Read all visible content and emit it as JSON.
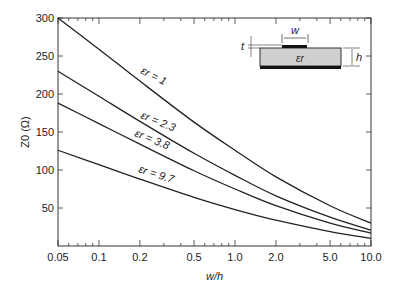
{
  "chart_data": {
    "type": "line",
    "title": "",
    "xlabel": "w/h",
    "ylabel": "Z0 (Ω)",
    "xscale": "log",
    "xlim": [
      0.05,
      10.0
    ],
    "ylim": [
      0,
      300
    ],
    "grid": false,
    "x_ticks": [
      "0.05",
      "0.1",
      "0.2",
      "0.5",
      "1.0",
      "2.0",
      "5.0",
      "10.0"
    ],
    "y_ticks": [
      "50",
      "100",
      "150",
      "200",
      "250",
      "300"
    ],
    "x": [
      0.05,
      0.1,
      0.2,
      0.5,
      1.0,
      2.0,
      5.0,
      10.0
    ],
    "series": [
      {
        "name": "εr = 1",
        "values": [
          300,
          259,
          217,
          163,
          126,
          91,
          53,
          30
        ]
      },
      {
        "name": "εr = 2.3",
        "values": [
          230,
          197,
          164,
          122,
          93,
          66,
          38,
          21
        ]
      },
      {
        "name": "εr = 3.8",
        "values": [
          188,
          161,
          134,
          99,
          75,
          53,
          30,
          17
        ]
      },
      {
        "name": "εr = 9.7",
        "values": [
          126,
          107,
          88,
          64,
          48,
          34,
          19,
          10
        ]
      }
    ],
    "annotations": [
      "εr = 1",
      "εr = 2.3",
      "εr = 3.8",
      "εr = 9.7"
    ],
    "inset": {
      "labels": {
        "w": "w",
        "t": "t",
        "h": "h",
        "er": "εr"
      }
    }
  }
}
